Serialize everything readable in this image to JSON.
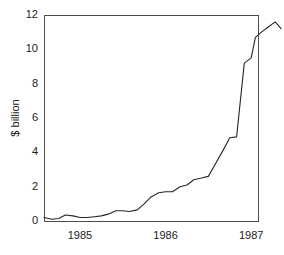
{
  "chart_data": {
    "type": "line",
    "title": "",
    "subtitle": "",
    "xlabel": "",
    "ylabel": "$ billion",
    "xlim": [
      1984.58,
      1987.08
    ],
    "ylim": [
      0,
      12
    ],
    "grid": false,
    "legend": null,
    "y_ticks": [
      0,
      2,
      4,
      6,
      8,
      10,
      12
    ],
    "y_tick_labels": [
      "0",
      "2",
      "4",
      "6",
      "8",
      "10",
      "12"
    ],
    "x_ticks": [
      1985,
      1986,
      1987
    ],
    "x_tick_labels": [
      "1985",
      "1986",
      "1987"
    ],
    "series": [
      {
        "name": "$ billion",
        "color": "#262626",
        "x": [
          1984.58,
          1984.67,
          1984.75,
          1984.83,
          1984.92,
          1985.0,
          1985.08,
          1985.17,
          1985.25,
          1985.33,
          1985.42,
          1985.5,
          1985.58,
          1985.67,
          1985.75,
          1985.83,
          1985.92,
          1986.0,
          1986.08,
          1986.17,
          1986.25,
          1986.33,
          1986.42,
          1986.5,
          1986.58,
          1986.67,
          1986.75,
          1986.83,
          1986.92,
          1987.0,
          1987.05
        ],
        "values": [
          0.2,
          0.1,
          0.15,
          0.35,
          0.3,
          0.2,
          0.2,
          0.25,
          0.3,
          0.4,
          0.6,
          0.6,
          0.55,
          0.65,
          1.0,
          1.4,
          1.65,
          1.7,
          1.7,
          2.0,
          2.1,
          2.4,
          2.5,
          2.6,
          3.3,
          4.1,
          4.85,
          4.9,
          9.2,
          9.5,
          10.7
        ]
      }
    ],
    "series_tail": {
      "x": [
        1987.05,
        1987.12,
        1987.2,
        1987.28,
        1987.35
      ],
      "values": [
        10.7,
        11.0,
        11.3,
        11.6,
        11.2
      ]
    },
    "plot_area": {
      "left": 44,
      "right": 258,
      "top": 15,
      "bottom": 221
    },
    "frame": {
      "color": "#4d4d4d",
      "sides": [
        "top",
        "right",
        "bottom",
        "left"
      ]
    },
    "background": "#ffffff"
  }
}
